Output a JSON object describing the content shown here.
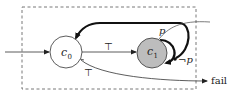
{
  "diagram": {
    "type": "automaton",
    "nodes": [
      {
        "id": "c0",
        "label": "c",
        "subscript": "0",
        "fill": "#ffffff"
      },
      {
        "id": "c1",
        "label": "c",
        "subscript": "1",
        "fill": "#bdbdbd"
      }
    ],
    "edges": [
      {
        "from": "start",
        "to": "c0",
        "label": ""
      },
      {
        "from": "c0",
        "to": "c1",
        "label": "⊤"
      },
      {
        "from": "c1",
        "to": "c0",
        "label": "",
        "style": "thick"
      },
      {
        "from": "c1",
        "to": "outside",
        "label": "p",
        "style": "thin"
      },
      {
        "from": "c1",
        "to": "c1",
        "label": "¬p",
        "style": "thick"
      },
      {
        "from": "c0",
        "to": "fail",
        "label": "⊤"
      }
    ],
    "labels": {
      "top_edge": "⊤",
      "bottom_edge": "⊤",
      "p": "p",
      "not_p": "¬p",
      "fail": "fail"
    }
  }
}
